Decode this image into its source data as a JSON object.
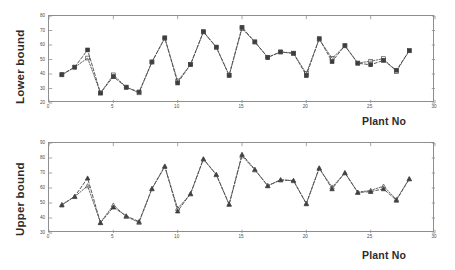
{
  "figure": {
    "background": "#ffffff",
    "line_color": "#3a3a3a",
    "axis_color": "#8e8e8e",
    "text_color": "#2b2b2b"
  },
  "chart_data": [
    {
      "type": "line",
      "id": "lower-bound",
      "title": "",
      "xlabel": "Plant No",
      "ylabel": "Lower bound",
      "xlim": [
        0,
        30
      ],
      "ylim": [
        20,
        80
      ],
      "xticks": [
        0,
        5,
        10,
        15,
        20,
        25,
        30
      ],
      "yticks": [
        20,
        30,
        40,
        50,
        60,
        70,
        80
      ],
      "xtick_labels": [
        "0",
        "5",
        "10",
        "15",
        "20",
        "25",
        "30"
      ],
      "ytick_labels": [
        "20",
        "30",
        "40",
        "50",
        "60",
        "70",
        "80"
      ],
      "grid": false,
      "legend": "none",
      "x": [
        1,
        2,
        3,
        4,
        5,
        6,
        7,
        8,
        9,
        10,
        11,
        12,
        13,
        14,
        15,
        16,
        17,
        18,
        19,
        20,
        21,
        22,
        23,
        24,
        25,
        26,
        27,
        28
      ],
      "series": [
        {
          "name": "Actual",
          "marker": "filled-square",
          "linestyle": "dashed",
          "color": "#3a3a3a",
          "values": [
            39.6,
            44.8,
            56.6,
            26.8,
            38.2,
            30.8,
            27.6,
            48.2,
            65.0,
            33.8,
            46.6,
            69.2,
            58.6,
            39.2,
            72.2,
            62.2,
            51.4,
            55.2,
            54.4,
            39.0,
            64.4,
            48.6,
            59.6,
            47.4,
            46.4,
            49.4,
            42.6,
            56.0
          ]
        },
        {
          "name": "Estimated",
          "marker": "open-square",
          "linestyle": "dotted",
          "color": "#4a4a4a",
          "values": [
            39.4,
            44.6,
            51.0,
            27.0,
            39.4,
            31.0,
            27.0,
            48.4,
            64.6,
            35.2,
            46.4,
            69.0,
            58.4,
            39.0,
            71.4,
            62.0,
            51.6,
            55.2,
            54.2,
            40.4,
            64.0,
            50.8,
            59.4,
            47.6,
            48.8,
            50.6,
            41.6,
            56.2
          ]
        }
      ]
    },
    {
      "type": "line",
      "id": "upper-bound",
      "title": "",
      "xlabel": "Plant No",
      "ylabel": "Upper bound",
      "xlim": [
        0,
        30
      ],
      "ylim": [
        30,
        90
      ],
      "xticks": [
        0,
        5,
        10,
        15,
        20,
        25,
        30
      ],
      "yticks": [
        30,
        40,
        50,
        60,
        70,
        80,
        90
      ],
      "xtick_labels": [
        "0",
        "5",
        "10",
        "15",
        "20",
        "25",
        "30"
      ],
      "ytick_labels": [
        "30",
        "40",
        "50",
        "60",
        "70",
        "80",
        "90"
      ],
      "grid": false,
      "legend": "none",
      "x": [
        1,
        2,
        3,
        4,
        5,
        6,
        7,
        8,
        9,
        10,
        11,
        12,
        13,
        14,
        15,
        16,
        17,
        18,
        19,
        20,
        21,
        22,
        23,
        24,
        25,
        26,
        27,
        28
      ],
      "series": [
        {
          "name": "Actual",
          "marker": "filled-triangle",
          "linestyle": "dashed",
          "color": "#3a3a3a",
          "values": [
            48.6,
            54.4,
            66.6,
            36.8,
            47.2,
            41.4,
            37.6,
            59.6,
            74.6,
            44.6,
            56.2,
            79.4,
            69.0,
            49.2,
            82.4,
            72.4,
            61.4,
            65.4,
            65.0,
            49.4,
            73.4,
            59.4,
            70.2,
            57.0,
            57.6,
            59.4,
            51.8,
            66.0
          ]
        },
        {
          "name": "Estimated",
          "marker": "open-triangle",
          "linestyle": "dotted",
          "color": "#4a4a4a",
          "values": [
            49.0,
            54.2,
            61.4,
            37.0,
            48.6,
            41.0,
            37.0,
            59.4,
            74.2,
            46.4,
            56.0,
            79.2,
            68.8,
            49.0,
            81.4,
            72.0,
            61.6,
            65.4,
            64.8,
            49.8,
            73.0,
            60.6,
            70.0,
            57.2,
            58.4,
            61.2,
            52.4,
            66.2
          ]
        }
      ]
    }
  ]
}
